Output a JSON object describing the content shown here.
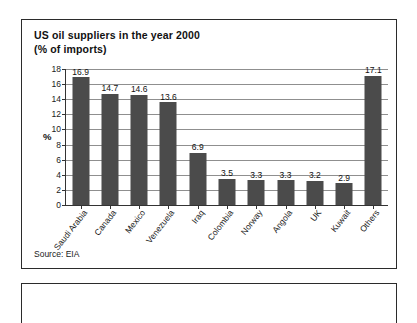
{
  "figure": {
    "title_line1": "US oil suppliers in the year 2000",
    "title_line2": "(% of imports)",
    "source": "Source: EIA",
    "bar_color": "#4b4b4b",
    "frame_color": "#2b2b2b",
    "gridline_color": "#8f8f8f"
  },
  "chart_data": {
    "type": "bar",
    "xlabel": "",
    "ylabel": "%",
    "ylim": [
      0,
      18
    ],
    "yticks": [
      0,
      2,
      4,
      6,
      8,
      10,
      12,
      14,
      16,
      18
    ],
    "ytick_labels": [
      "0",
      "2",
      "4",
      "6",
      "8",
      "10",
      "12",
      "14",
      "16",
      "18"
    ],
    "grid": true,
    "legend": false,
    "data_labels": true,
    "categories": [
      "Saudi Arabia",
      "Canada",
      "Mexico",
      "Venezuela",
      "Iraq",
      "Colombia",
      "Norway",
      "Angola",
      "UK",
      "Kuwait",
      "Others"
    ],
    "values": [
      16.9,
      14.7,
      14.6,
      13.6,
      6.9,
      3.5,
      3.3,
      3.3,
      3.2,
      2.9,
      17.1
    ],
    "value_labels": [
      "16.9",
      "14.7",
      "14.6",
      "13.6",
      "6.9",
      "3.5",
      "3.3",
      "3.3",
      "3.2",
      "2.9",
      "17.1"
    ],
    "source": "Source: EIA"
  }
}
